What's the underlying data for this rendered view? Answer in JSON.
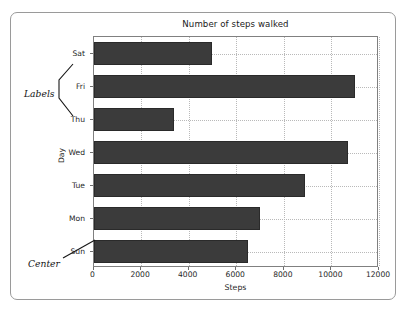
{
  "chart_data": {
    "type": "bar",
    "orientation": "horizontal",
    "title": "Number of steps walked",
    "xlabel": "Steps",
    "ylabel": "Day",
    "categories": [
      "Sun",
      "Mon",
      "Tue",
      "Wed",
      "Thu",
      "Fri",
      "Sat"
    ],
    "values": [
      6500,
      7000,
      8900,
      10700,
      3400,
      11000,
      5000
    ],
    "category_order_top_to_bottom": [
      "Sat",
      "Fri",
      "Thu",
      "Wed",
      "Tue",
      "Mon",
      "Sun"
    ],
    "xlim": [
      0,
      12000
    ],
    "xticks": [
      0,
      2000,
      4000,
      6000,
      8000,
      10000,
      12000
    ],
    "xtick_labels": [
      "0",
      "2000",
      "4000",
      "6000",
      "8000",
      "10000",
      "12000"
    ],
    "grid": true,
    "legend": null,
    "bar_color": "#3b3b3b",
    "grid_color": "#b9b9b9",
    "annotations": [
      {
        "text": "Labels",
        "style": "italic",
        "points_to": "y-axis-tick-labels"
      },
      {
        "text": "Center",
        "style": "italic",
        "points_to": "sun-bar-center"
      }
    ]
  },
  "axis": {
    "x_tick_labels": [
      "0",
      "2000",
      "4000",
      "6000",
      "8000",
      "10000",
      "12000"
    ],
    "y_tick_labels_top_to_bottom": [
      "Sat",
      "Fri",
      "Thu",
      "Wed",
      "Tue",
      "Mon",
      "Sun"
    ],
    "x_title": "Steps",
    "y_title": "Day"
  },
  "annotations": {
    "labels": "Labels",
    "center": "Center"
  }
}
